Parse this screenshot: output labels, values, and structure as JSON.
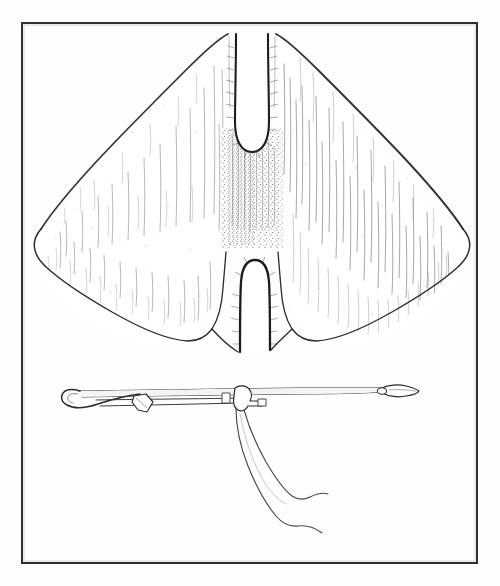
{
  "plate": {
    "kind": "scanned-line-art-illustration",
    "title": "Whale fluke and hand-held lance plate",
    "background_color": "#fefefe",
    "ink_color": "#2b2b2b",
    "frame": {
      "name": "plate-border",
      "x": 21,
      "y": 22,
      "width": 457,
      "height": 542,
      "stroke_width": 2,
      "stroke_color": "#2f2f2f"
    },
    "figures": [
      {
        "id": "whale-fluke",
        "label": "Whale fluke (tail flukes), dorsal view",
        "description": "Broad bilobed tail with two deep rounded notches along the vertical midline, pointed lateral tips, stippled median column and fine vertical hatching across both lobes.",
        "bounds": {
          "x": 34,
          "y": 30,
          "width": 430,
          "height": 325
        },
        "features": [
          "upper-left-peak",
          "upper-right-peak",
          "upper-notch",
          "median-stippled-column",
          "lower-notch",
          "left-lateral-tip",
          "right-lateral-tip",
          "lower-left-tip",
          "lower-right-tip"
        ]
      },
      {
        "id": "lance-with-line",
        "label": "Barbed lance / harpoon with attached line",
        "description": "Long slender horizontal shaft; hooked recurved barb at left end, lanceolate leaf point with small eye at right end, toggle lug near centre, double-stranded line running down and to the right.",
        "bounds": {
          "x": 70,
          "y": 384,
          "width": 350,
          "height": 160
        },
        "features": [
          "left-recurved-barb",
          "shaft",
          "mid-lug",
          "right-leaf-point",
          "point-eye",
          "attached-line-upper-strand",
          "attached-line-lower-strand"
        ]
      }
    ]
  },
  "chart_data": null
}
